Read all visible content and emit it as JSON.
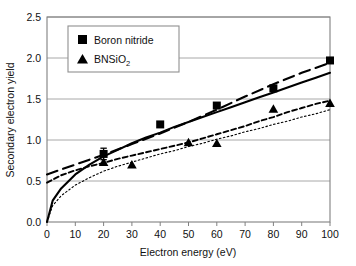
{
  "chart_data": {
    "type": "scatter",
    "title": "",
    "xlabel": "Electron energy (eV)",
    "ylabel": "Secondary electron yield",
    "xlim": [
      0,
      100
    ],
    "ylim": [
      0.0,
      2.5
    ],
    "xticks": [
      0,
      10,
      20,
      30,
      40,
      50,
      60,
      70,
      80,
      90,
      100
    ],
    "xtick_labels": [
      "0",
      "10",
      "20",
      "30",
      "40",
      "50",
      "60",
      "70",
      "80",
      "90",
      "100"
    ],
    "yticks": [
      0.0,
      0.5,
      1.0,
      1.5,
      2.0,
      2.5
    ],
    "ytick_labels": [
      "0.0",
      "0.5",
      "1.0",
      "1.5",
      "2.0",
      "2.5"
    ],
    "grid": "horizontal",
    "legend_position": "top-left",
    "legend": [
      {
        "label": "Boron nitride",
        "marker": "square",
        "marker_glyph": "■"
      },
      {
        "label": "BNSiO",
        "label_sub": "2",
        "marker": "triangle",
        "marker_glyph": "▲"
      }
    ],
    "series": [
      {
        "name": "Boron nitride",
        "marker": "square",
        "x": [
          20,
          40,
          60,
          80,
          100
        ],
        "values": [
          0.83,
          1.19,
          1.42,
          1.63,
          1.97
        ],
        "error_bars": [
          0.07,
          0,
          0,
          0,
          0
        ]
      },
      {
        "name": "BNSiO2",
        "marker": "triangle",
        "x": [
          20,
          30,
          50,
          60,
          80,
          100
        ],
        "values": [
          0.73,
          0.7,
          0.97,
          0.96,
          1.38,
          1.45
        ],
        "error_bars": [
          0,
          0,
          0,
          0,
          0,
          0
        ]
      }
    ],
    "fit_curves": [
      {
        "name": "Boron nitride fit (solid)",
        "style": "solid",
        "for_series": "Boron nitride",
        "x": [
          0,
          2,
          5,
          10,
          15,
          20,
          25,
          30,
          35,
          40,
          45,
          50,
          55,
          60,
          65,
          70,
          75,
          80,
          85,
          90,
          95,
          100
        ],
        "values": [
          0.0,
          0.26,
          0.41,
          0.58,
          0.7,
          0.8,
          0.88,
          0.96,
          1.03,
          1.09,
          1.16,
          1.22,
          1.28,
          1.34,
          1.4,
          1.46,
          1.52,
          1.58,
          1.64,
          1.7,
          1.76,
          1.82
        ]
      },
      {
        "name": "Boron nitride alternate (long dash)",
        "style": "long-dash",
        "for_series": "Boron nitride",
        "x": [
          0,
          10,
          20,
          30,
          40,
          50,
          60,
          70,
          80,
          90,
          100
        ],
        "values": [
          0.58,
          0.7,
          0.82,
          0.95,
          1.08,
          1.22,
          1.37,
          1.53,
          1.68,
          1.82,
          1.94
        ]
      },
      {
        "name": "BNSiO2 fit (short dash)",
        "style": "short-dash",
        "for_series": "BNSiO2",
        "x": [
          0,
          5,
          10,
          15,
          20,
          25,
          30,
          35,
          40,
          45,
          50,
          55,
          60,
          65,
          70,
          75,
          80,
          85,
          90,
          95,
          100
        ],
        "values": [
          0.48,
          0.57,
          0.63,
          0.68,
          0.72,
          0.77,
          0.81,
          0.85,
          0.89,
          0.93,
          0.97,
          1.02,
          1.07,
          1.12,
          1.17,
          1.23,
          1.28,
          1.34,
          1.39,
          1.44,
          1.48
        ]
      },
      {
        "name": "BNSiO2 alternate (dotted)",
        "style": "dotted",
        "for_series": "BNSiO2",
        "x": [
          0,
          2,
          5,
          10,
          15,
          20,
          25,
          30,
          35,
          40,
          45,
          50,
          55,
          60,
          65,
          70,
          75,
          80,
          85,
          90,
          95,
          100
        ],
        "values": [
          0.0,
          0.2,
          0.32,
          0.45,
          0.54,
          0.62,
          0.68,
          0.73,
          0.78,
          0.83,
          0.87,
          0.92,
          0.96,
          1.01,
          1.05,
          1.1,
          1.14,
          1.19,
          1.23,
          1.28,
          1.32,
          1.37
        ]
      }
    ],
    "colors": {
      "series": "#000000",
      "grid": "#a8a8a8",
      "frame": "#808080",
      "legend_border": "#909090",
      "background": "#ffffff"
    }
  }
}
